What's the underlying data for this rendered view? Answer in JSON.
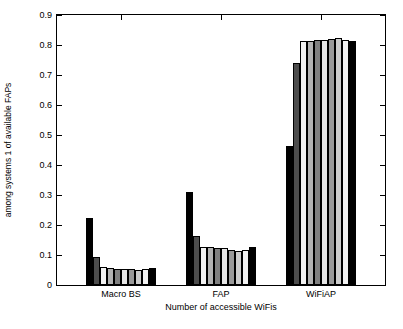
{
  "chart_data": {
    "type": "bar",
    "title": "",
    "xlabel": "Number of accessible WiFis",
    "ylabel": "Distribution of the served traffic of inside users among systems 1 of available  FAPs",
    "ylabel_lines": [
      "Distribution of the served traffic of inside users",
      "among systems 1 of available  FAPs"
    ],
    "ylim": [
      0,
      0.9
    ],
    "ytick_labels": [
      "0",
      "0.1",
      "0.2",
      "0.3",
      "0.4",
      "0.5",
      "0.6",
      "0.7",
      "0.8",
      "0.9"
    ],
    "ytick_values": [
      0,
      0.1,
      0.2,
      0.3,
      0.4,
      0.5,
      0.6,
      0.7,
      0.8,
      0.9
    ],
    "categories": [
      "Macro BS",
      "FAP",
      "WiFiAP"
    ],
    "grid": false,
    "legend": "none",
    "series": [
      {
        "name": "1",
        "color": "#000000",
        "values": [
          0.225,
          0.31,
          0.465
        ]
      },
      {
        "name": "2",
        "color": "#4d4d4d",
        "values": [
          0.092,
          0.163,
          0.74
        ]
      },
      {
        "name": "3",
        "color": "#f2f2f2",
        "values": [
          0.06,
          0.126,
          0.812
        ]
      },
      {
        "name": "4",
        "color": "#b3b3b3",
        "values": [
          0.058,
          0.127,
          0.815
        ]
      },
      {
        "name": "5",
        "color": "#808080",
        "values": [
          0.055,
          0.124,
          0.818
        ]
      },
      {
        "name": "6",
        "color": "#e6e6e6",
        "values": [
          0.055,
          0.123,
          0.818
        ]
      },
      {
        "name": "7",
        "color": "#999999",
        "values": [
          0.052,
          0.118,
          0.82
        ]
      },
      {
        "name": "8",
        "color": "#cccccc",
        "values": [
          0.05,
          0.112,
          0.825
        ]
      },
      {
        "name": "9",
        "color": "#f2f2f2",
        "values": [
          0.052,
          0.118,
          0.818
        ]
      },
      {
        "name": "10",
        "color": "#000000",
        "values": [
          0.058,
          0.128,
          0.815
        ]
      }
    ]
  }
}
